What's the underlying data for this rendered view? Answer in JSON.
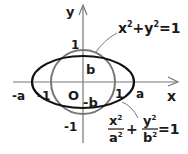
{
  "diagram": {
    "axes": {
      "x_label": "x",
      "y_label": "y",
      "origin_label": "O"
    },
    "ticks": {
      "x_neg_a": "-a",
      "x_neg_1": "-1",
      "x_pos_1": "1",
      "x_pos_a": "a",
      "y_pos_1": "1",
      "y_neg_1": "-1",
      "y_pos_b": "b",
      "y_neg_b": "-b"
    },
    "circle": {
      "equation_parts": {
        "x": "x",
        "y": "y",
        "exp": "2",
        "plus": "+",
        "eq": "=1"
      },
      "color": "#777777"
    },
    "ellipse": {
      "equation_parts": {
        "x": "x",
        "y": "y",
        "a": "a",
        "b": "b",
        "exp": "2",
        "plus": "+",
        "eq": "=1"
      },
      "color": "#111111"
    }
  }
}
